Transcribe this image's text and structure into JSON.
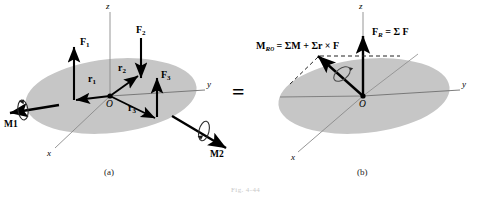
{
  "figure": {
    "caption": "Fig. 4-44",
    "background_color": "#ffffff",
    "body_fill_color": "#c6c6c6",
    "line_color": "#000000",
    "axis_color": "#808080"
  },
  "panel_a": {
    "label": "(a)",
    "axes": {
      "x": "x",
      "y": "y",
      "z": "z"
    },
    "origin": "O",
    "forces": [
      {
        "name": "F1",
        "label_main": "F",
        "label_sub": "1"
      },
      {
        "name": "F2",
        "label_main": "F",
        "label_sub": "2"
      },
      {
        "name": "F3",
        "label_main": "F",
        "label_sub": "3"
      }
    ],
    "position_vectors": [
      {
        "name": "r1",
        "label_main": "r",
        "label_sub": "1"
      },
      {
        "name": "r2",
        "label_main": "r",
        "label_sub": "2"
      },
      {
        "name": "r3",
        "label_main": "r",
        "label_sub": "3"
      }
    ],
    "couple_moments": [
      {
        "name": "M1",
        "label_main": "M",
        "label_sub": "1"
      },
      {
        "name": "M2",
        "label_main": "M",
        "label_sub": "2"
      }
    ]
  },
  "panel_b": {
    "label": "(b)",
    "axes": {
      "x": "x",
      "y": "y",
      "z": "z"
    },
    "origin": "O",
    "resultant_force": {
      "name": "FR",
      "label_main": "F",
      "label_sub": "R",
      "equals": " = Σ F"
    },
    "resultant_moment": {
      "name": "MRO",
      "label_main": "M",
      "label_sub": "R",
      "label_subsub": "O",
      "equals": " = ΣM + Σr × F"
    }
  },
  "equivalence": {
    "symbol": "="
  }
}
